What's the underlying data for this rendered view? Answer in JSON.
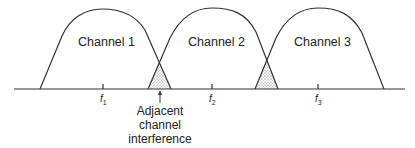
{
  "diagram": {
    "type": "frequency-spectrum-channels",
    "channels": [
      {
        "label": "Channel 1",
        "center_freq": "f",
        "center_sub": "1"
      },
      {
        "label": "Channel 2",
        "center_freq": "f",
        "center_sub": "2"
      },
      {
        "label": "Channel 3",
        "center_freq": "f",
        "center_sub": "3"
      }
    ],
    "annotation": {
      "line1": "Adjacent",
      "line2": "channel",
      "line3": "interference"
    },
    "colors": {
      "stroke": "#333333",
      "fill_overlap": "#bbbbbb",
      "background": "#ffffff"
    }
  }
}
